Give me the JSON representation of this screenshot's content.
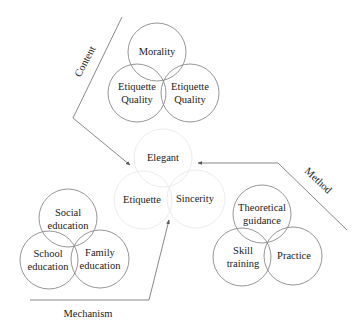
{
  "diagram": {
    "center_group": {
      "circles": [
        {
          "id": "elegant",
          "label": "Elegant",
          "cx": 163,
          "cy": 158
        },
        {
          "id": "etiquette",
          "label": "Etiquette",
          "cx": 143,
          "cy": 200
        },
        {
          "id": "sincerity",
          "label": "Sincerity",
          "cx": 196,
          "cy": 199
        }
      ],
      "stroke_color": "#ececec"
    },
    "content_group": {
      "arm_label": "Content",
      "circles": [
        {
          "id": "morality",
          "lines": [
            "Morality"
          ],
          "cx": 157,
          "cy": 52
        },
        {
          "id": "etiquette-quality-left",
          "lines": [
            "Etiquette",
            "Quality"
          ],
          "cx": 137,
          "cy": 93
        },
        {
          "id": "etiquette-quality-right",
          "lines": [
            "Etiquette",
            "Quality"
          ],
          "cx": 190,
          "cy": 93
        }
      ]
    },
    "mechanism_group": {
      "arm_label": "Mechanism",
      "circles": [
        {
          "id": "social-education",
          "lines": [
            "Social",
            "education"
          ],
          "cx": 68,
          "cy": 218
        },
        {
          "id": "school-education",
          "lines": [
            "School",
            "education"
          ],
          "cx": 49,
          "cy": 260
        },
        {
          "id": "family-education",
          "lines": [
            "Family",
            "education"
          ],
          "cx": 100,
          "cy": 259
        }
      ]
    },
    "method_group": {
      "arm_label": "Method",
      "circles": [
        {
          "id": "theoretical-guidance",
          "lines": [
            "Theoretical",
            "guidance"
          ],
          "cx": 262,
          "cy": 214
        },
        {
          "id": "skill-training",
          "lines": [
            "Skill",
            "training"
          ],
          "cx": 242,
          "cy": 257
        },
        {
          "id": "practice",
          "lines": [
            "Practice"
          ],
          "cx": 293,
          "cy": 256
        }
      ]
    },
    "circle_radius": 29,
    "stroke_color": "#8a8a8a",
    "connector_color": "#7a7a7a"
  }
}
